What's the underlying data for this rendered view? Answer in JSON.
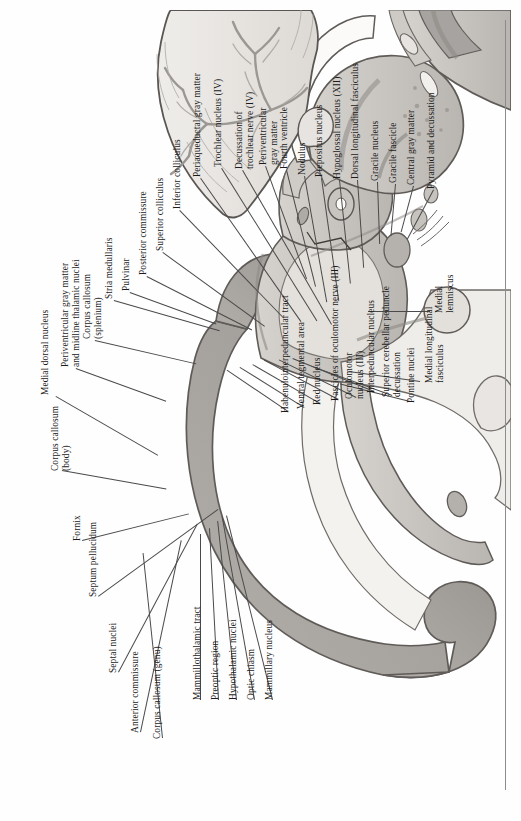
{
  "figure": {
    "kind": "anatomical-plate",
    "orientation": "labels rotated 90 degrees counter-clockwise (sideways page)"
  },
  "colors": {
    "page_background": "#fefefe",
    "ink": "#1b1b1b",
    "leader_line": "#4a4a4a",
    "page_rule": "#8c8c8c",
    "gray_matter_dark": "#a9a6a4",
    "gray_matter_mid": "#c3c0bd",
    "white_matter_light": "#e8e6e3",
    "outline": "#6a6663",
    "cerebellum_fill": "#dedbd7",
    "arbor_vitae": "#b6b2ae"
  },
  "labels_top_left": [
    {
      "id": "medial-dorsal-nucleus",
      "text": "Medial dorsal nucleus"
    },
    {
      "id": "periventricular-gray-matter-midline-thalamic-nuclei",
      "text": "Periventricular gray matter\nand midline thalamic nuclei"
    },
    {
      "id": "corpus-callosum-splenium",
      "text": "Corpus callosum\n(splenium)"
    },
    {
      "id": "stria-medullaris",
      "text": "Stria medullaris"
    },
    {
      "id": "pulvinar",
      "text": "Pulvinar"
    },
    {
      "id": "posterior-commissure",
      "text": "Posterior commissure"
    },
    {
      "id": "superior-colliculus",
      "text": "Superior colliculus"
    },
    {
      "id": "inferior-colliculus",
      "text": "Inferior colliculus"
    },
    {
      "id": "periaqueductal-gray-matter",
      "text": "Periaqueductal gray matter"
    },
    {
      "id": "trochlear-nucleus-iv",
      "text": "Trochlear nucleus (IV)"
    },
    {
      "id": "decussation-of-trochlear-nerve-iv",
      "text": "Decussation of\ntrochlear nerve (IV)"
    },
    {
      "id": "periventricular-gray-matter",
      "text": "Periventricular\ngray matter"
    },
    {
      "id": "fourth-ventricle",
      "text": "Fourth ventricle"
    },
    {
      "id": "nodulus",
      "text": "Nodulus"
    },
    {
      "id": "prepositus-nucleus",
      "text": "Prepositus nucleus"
    },
    {
      "id": "hypoglossal-nucleus-xii",
      "text": "Hypoglossal nucleus (XII)"
    },
    {
      "id": "dorsal-longitudinal-fasciculus",
      "text": "Dorsal longitudinal fasciculus"
    },
    {
      "id": "gracile-nucleus",
      "text": "Gracile nucleus"
    },
    {
      "id": "gracile-fascicle",
      "text": "Gracile fascicle"
    },
    {
      "id": "central-gray-matter",
      "text": "Central gray matter"
    },
    {
      "id": "pyramid-and-decussation",
      "text": "Pyramid and decussation"
    }
  ],
  "labels_right": [
    {
      "id": "medial-lemniscus",
      "text": "Medial\nlemniscus"
    },
    {
      "id": "medial-longitudinal-fasciculus",
      "text": "Medial longitudinal\nfasciculus"
    },
    {
      "id": "pontine-nuclei",
      "text": "Pontine nuclei"
    },
    {
      "id": "superior-cerebellar-peduncle-decussation",
      "text": "Superior cerebellar peduncle\ndecussation"
    },
    {
      "id": "interpeduncular-nucleus",
      "text": "Interpeduncular nucleus"
    },
    {
      "id": "oculomotor-nucleus-iii",
      "text": "Oculomotor\nnucleus (III)"
    },
    {
      "id": "fascicles-of-oculomotor-nerve-iii",
      "text": "Fascicles of oculomotor nerve (III)"
    },
    {
      "id": "red-nucleus",
      "text": "Red nucleus"
    },
    {
      "id": "ventral-tegmental-area",
      "text": "Ventral tegmental area"
    },
    {
      "id": "habenulointerpeduncular-tract",
      "text": "Habenulointerpeduncular tract"
    }
  ],
  "labels_bottom": [
    {
      "id": "mammillary-nucleus",
      "text": "Mammillary nucleus"
    },
    {
      "id": "optic-chiasm",
      "text": "Optic chiasm"
    },
    {
      "id": "hypothalamic-nuclei",
      "text": "Hypothalamic nuclei"
    },
    {
      "id": "preoptic-region",
      "text": "Preoptic region"
    },
    {
      "id": "mammillothalamic-tract",
      "text": "Mammillothalamic tract"
    },
    {
      "id": "corpus-callosum-genu",
      "text": "Corpus callosum (genu)"
    },
    {
      "id": "anterior-commissure",
      "text": "Anterior commissure"
    },
    {
      "id": "septal-nuclei",
      "text": "Septal nuclei"
    },
    {
      "id": "septum-pellucidum",
      "text": "Septum pellucidum"
    },
    {
      "id": "fornix",
      "text": "Fornix"
    },
    {
      "id": "corpus-callosum-body",
      "text": "Corpus callosum\n(body)"
    }
  ]
}
